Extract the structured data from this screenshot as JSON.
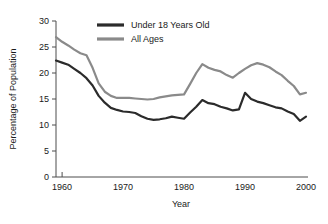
{
  "chart_data": {
    "type": "line",
    "title": "",
    "xlabel": "Year",
    "ylabel": "Percentage of Population",
    "xlim": [
      1959,
      2000
    ],
    "ylim": [
      0,
      30
    ],
    "xticks": [
      1960,
      1970,
      1980,
      1990,
      2000
    ],
    "xtick_labels": [
      "1960",
      "1970",
      "1980",
      "1990",
      "2000"
    ],
    "yticks": [
      0,
      5,
      10,
      15,
      20,
      25,
      30
    ],
    "ytick_labels": [
      "0",
      "5",
      "10",
      "15",
      "20",
      "25",
      "30"
    ],
    "grid": false,
    "legend_position": "top-center",
    "x": [
      1959,
      1960,
      1961,
      1962,
      1963,
      1964,
      1965,
      1966,
      1967,
      1968,
      1969,
      1970,
      1971,
      1972,
      1973,
      1974,
      1975,
      1976,
      1977,
      1978,
      1979,
      1980,
      1981,
      1982,
      1983,
      1984,
      1985,
      1986,
      1987,
      1988,
      1989,
      1990,
      1991,
      1992,
      1993,
      1994,
      1995,
      1996,
      1997,
      1998,
      1999,
      2000
    ],
    "series": [
      {
        "name": "Under 18 Years Old",
        "color": "#2b2b2b",
        "values": [
          22.4,
          22.0,
          21.6,
          20.8,
          20.0,
          19.0,
          17.6,
          15.6,
          14.3,
          13.3,
          12.9,
          12.6,
          12.5,
          12.3,
          11.7,
          11.2,
          11.0,
          11.1,
          11.3,
          11.6,
          11.4,
          11.2,
          12.4,
          13.5,
          14.8,
          14.2,
          14.0,
          13.5,
          13.2,
          12.8,
          13.0,
          16.2,
          15.0,
          14.5,
          14.2,
          13.8,
          13.4,
          13.2,
          12.6,
          12.1,
          10.8,
          11.6
        ]
      },
      {
        "name": "All Ages",
        "color": "#8a8a8a",
        "values": [
          26.9,
          26.0,
          25.3,
          24.5,
          23.8,
          23.4,
          21.0,
          18.0,
          16.4,
          15.6,
          15.2,
          15.2,
          15.2,
          15.1,
          15.0,
          14.9,
          15.0,
          15.3,
          15.5,
          15.7,
          15.8,
          15.9,
          17.9,
          20.0,
          21.7,
          21.0,
          20.6,
          20.3,
          19.6,
          19.1,
          20.0,
          20.8,
          21.5,
          21.9,
          21.6,
          21.1,
          20.3,
          19.6,
          18.5,
          17.5,
          15.9,
          16.2
        ]
      }
    ],
    "legend": [
      {
        "label": "Under 18 Years Old",
        "color": "#2b2b2b"
      },
      {
        "label": "All Ages",
        "color": "#8a8a8a"
      }
    ]
  }
}
